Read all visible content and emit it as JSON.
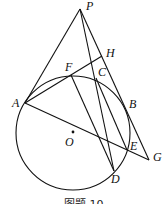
{
  "figure": {
    "caption": "图题 10",
    "circle": {
      "center": "O",
      "cx": 73,
      "cy": 133,
      "r": 57
    },
    "points": [
      {
        "name": "P",
        "x": 80,
        "y": 9,
        "lx": 86,
        "ly": 10
      },
      {
        "name": "H",
        "x": 102,
        "y": 56,
        "lx": 106,
        "ly": 57
      },
      {
        "name": "F",
        "x": 71,
        "y": 75,
        "lx": 65,
        "ly": 71
      },
      {
        "name": "C",
        "x": 96,
        "y": 78,
        "lx": 98,
        "ly": 76
      },
      {
        "name": "A",
        "x": 25,
        "y": 103,
        "lx": 12,
        "ly": 107
      },
      {
        "name": "B",
        "x": 124,
        "y": 106,
        "lx": 129,
        "ly": 108
      },
      {
        "name": "O",
        "x": 73,
        "y": 132,
        "lx": 65,
        "ly": 146
      },
      {
        "name": "E",
        "x": 127,
        "y": 150,
        "lx": 130,
        "ly": 150
      },
      {
        "name": "G",
        "x": 149,
        "y": 160,
        "lx": 153,
        "ly": 161
      },
      {
        "name": "D",
        "x": 114,
        "y": 171,
        "lx": 111,
        "ly": 183
      }
    ],
    "segments": [
      [
        "P",
        "A"
      ],
      [
        "P",
        "G"
      ],
      [
        "P",
        "D"
      ],
      [
        "A",
        "H"
      ],
      [
        "A",
        "G"
      ],
      [
        "F",
        "D"
      ],
      [
        "C",
        "E"
      ]
    ]
  }
}
